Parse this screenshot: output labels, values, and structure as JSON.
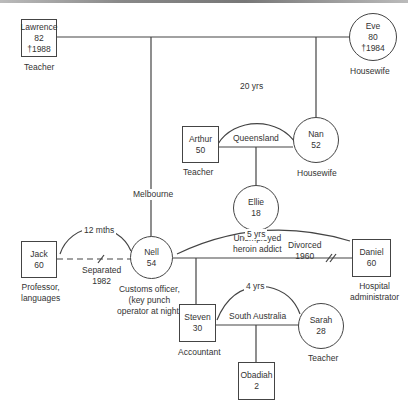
{
  "diagram_type": "genogram",
  "people": {
    "lawrence": {
      "name": "Lawrence",
      "age": "82",
      "died": "†1988",
      "occupation": "Teacher"
    },
    "eve": {
      "name": "Eve",
      "age": "80",
      "died": "†1984",
      "occupation": "Housewife"
    },
    "arthur": {
      "name": "Arthur",
      "age": "50",
      "occupation": "Teacher"
    },
    "nan": {
      "name": "Nan",
      "age": "52",
      "occupation": "Housewife"
    },
    "ellie": {
      "name": "Ellie",
      "age": "18",
      "occupation_line1": "Unemployed",
      "occupation_line2": "heroin addict"
    },
    "jack": {
      "name": "Jack",
      "age": "60",
      "occupation_line1": "Professor,",
      "occupation_line2": "languages"
    },
    "nell": {
      "name": "Nell",
      "age": "54",
      "occupation_line1": "Customs officer,",
      "occupation_line2": "(key punch",
      "occupation_line3": "operator at night)"
    },
    "daniel": {
      "name": "Daniel",
      "age": "60",
      "occupation_line1": "Hospital",
      "occupation_line2": "administrator"
    },
    "steven": {
      "name": "Steven",
      "age": "30",
      "occupation": "Accountant"
    },
    "sarah": {
      "name": "Sarah",
      "age": "28",
      "occupation": "Teacher"
    },
    "obadiah": {
      "name": "Obadiah",
      "age": "2"
    }
  },
  "relationships": {
    "lawrence_eve": {
      "place": "Melbourne"
    },
    "arthur_nan": {
      "duration": "20 yrs",
      "place": "Queensland"
    },
    "jack_nell": {
      "duration": "12 mths",
      "status_line1": "Separated",
      "status_line2": "1982"
    },
    "nell_daniel": {
      "duration": "5 yrs",
      "status_line1": "Divorced",
      "status_line2": "1960"
    },
    "steven_sarah": {
      "duration": "4 yrs",
      "place": "South Australia"
    }
  }
}
